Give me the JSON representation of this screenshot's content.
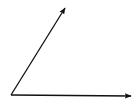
{
  "diagram": {
    "type": "angle",
    "background": "#ffffff",
    "stroke_color": "#111111",
    "stroke_width": 1.3,
    "vertex": {
      "x": 11,
      "y": 95
    },
    "rays": [
      {
        "name": "upper-ray",
        "from": {
          "x": 11,
          "y": 95
        },
        "to": {
          "x": 65,
          "y": 8
        },
        "arrowhead": true
      },
      {
        "name": "horizontal-ray",
        "from": {
          "x": 11,
          "y": 95
        },
        "to": {
          "x": 131,
          "y": 96
        },
        "arrowhead": true
      }
    ]
  }
}
